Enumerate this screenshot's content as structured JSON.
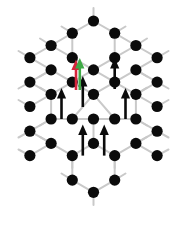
{
  "figure": {
    "type": "lattice-diagram",
    "width": 187,
    "height": 226,
    "background_color": "#ffffff"
  },
  "style": {
    "node_color": "#0b0b0b",
    "node_radius": 5.6,
    "bond_color": "#c9c9c9",
    "bond_width": 2.0,
    "black_arrow_color": "#0b0b0b",
    "red_arrow_color": "#d6253c",
    "green_arrow_color": "#3faa46"
  },
  "lattice": {
    "description": "Honeycomb (graphene-like) lattice arranged as a hexagonal flower of seven hexagons",
    "center": [
      93.5,
      107.0
    ],
    "bond_length": 24.5,
    "node_count": 38,
    "nodes": [
      {
        "id": "n01",
        "x": 93.5,
        "y": 21.0,
        "label": "top-apex"
      },
      {
        "id": "n02",
        "x": 72.3,
        "y": 33.2,
        "label": "upper-ring"
      },
      {
        "id": "n03",
        "x": 114.7,
        "y": 33.2,
        "label": "upper-ring"
      },
      {
        "id": "n04",
        "x": 72.3,
        "y": 57.7,
        "label": "upper-ring"
      },
      {
        "id": "n05",
        "x": 114.7,
        "y": 57.7,
        "label": "upper-ring"
      },
      {
        "id": "n06",
        "x": 51.1,
        "y": 45.5,
        "label": "upper-left"
      },
      {
        "id": "n07",
        "x": 135.9,
        "y": 45.5,
        "label": "upper-right"
      },
      {
        "id": "n08",
        "x": 29.9,
        "y": 57.7,
        "label": "left-ring"
      },
      {
        "id": "n09",
        "x": 157.1,
        "y": 57.7,
        "label": "right-ring"
      },
      {
        "id": "n10",
        "x": 51.1,
        "y": 69.9,
        "label": "left-ring"
      },
      {
        "id": "n11",
        "x": 93.5,
        "y": 69.9,
        "label": "center-upper"
      },
      {
        "id": "n12",
        "x": 135.9,
        "y": 69.9,
        "label": "right-ring"
      },
      {
        "id": "n13",
        "x": 29.9,
        "y": 82.1,
        "label": "left-ring"
      },
      {
        "id": "n14",
        "x": 157.1,
        "y": 82.1,
        "label": "right-ring"
      },
      {
        "id": "n15",
        "x": 51.1,
        "y": 94.3,
        "label": "left-ring"
      },
      {
        "id": "n16",
        "x": 93.5,
        "y": 94.3,
        "label": "center"
      },
      {
        "id": "n17",
        "x": 135.9,
        "y": 94.3,
        "label": "right-ring"
      },
      {
        "id": "n18",
        "x": 72.3,
        "y": 82.1,
        "label": "inner"
      },
      {
        "id": "n19",
        "x": 114.7,
        "y": 82.1,
        "label": "inner"
      },
      {
        "id": "n20",
        "x": 29.9,
        "y": 106.5,
        "label": "left-edge"
      },
      {
        "id": "n21",
        "x": 157.1,
        "y": 106.5,
        "label": "right-edge"
      },
      {
        "id": "n22",
        "x": 72.3,
        "y": 119.0,
        "label": "inner"
      },
      {
        "id": "n23",
        "x": 114.7,
        "y": 119.0,
        "label": "inner"
      },
      {
        "id": "n24",
        "x": 51.1,
        "y": 119.0,
        "label": "left-ring"
      },
      {
        "id": "n25",
        "x": 93.5,
        "y": 119.0,
        "label": "center-lower"
      },
      {
        "id": "n26",
        "x": 135.9,
        "y": 119.0,
        "label": "right-ring"
      },
      {
        "id": "n27",
        "x": 29.9,
        "y": 131.2,
        "label": "left-ring"
      },
      {
        "id": "n28",
        "x": 157.1,
        "y": 131.2,
        "label": "right-ring"
      },
      {
        "id": "n29",
        "x": 51.1,
        "y": 143.4,
        "label": "left-ring"
      },
      {
        "id": "n30",
        "x": 93.5,
        "y": 143.4,
        "label": "lower-center"
      },
      {
        "id": "n31",
        "x": 135.9,
        "y": 143.4,
        "label": "right-ring"
      },
      {
        "id": "n32",
        "x": 72.3,
        "y": 155.6,
        "label": "lower"
      },
      {
        "id": "n33",
        "x": 114.7,
        "y": 155.6,
        "label": "lower"
      },
      {
        "id": "n34",
        "x": 29.9,
        "y": 155.6,
        "label": "lower-left"
      },
      {
        "id": "n35",
        "x": 157.1,
        "y": 155.6,
        "label": "lower-right"
      },
      {
        "id": "n36",
        "x": 72.3,
        "y": 180.1,
        "label": "lower-ring"
      },
      {
        "id": "n37",
        "x": 114.7,
        "y": 180.1,
        "label": "lower-ring"
      },
      {
        "id": "n38",
        "x": 93.5,
        "y": 192.3,
        "label": "bottom-apex"
      }
    ],
    "bonds": [
      [
        "n01",
        "n02"
      ],
      [
        "n01",
        "n03"
      ],
      [
        "n02",
        "n04"
      ],
      [
        "n03",
        "n05"
      ],
      [
        "n02",
        "n06"
      ],
      [
        "n03",
        "n07"
      ],
      [
        "n06",
        "n08"
      ],
      [
        "n07",
        "n09"
      ],
      [
        "n06",
        "n04"
      ],
      [
        "n07",
        "n05"
      ],
      [
        "n04",
        "n11"
      ],
      [
        "n05",
        "n11"
      ],
      [
        "n08",
        "n10"
      ],
      [
        "n09",
        "n12"
      ],
      [
        "n10",
        "n13"
      ],
      [
        "n12",
        "n14"
      ],
      [
        "n10",
        "n18"
      ],
      [
        "n12",
        "n19"
      ],
      [
        "n11",
        "n18"
      ],
      [
        "n11",
        "n19"
      ],
      [
        "n13",
        "n15"
      ],
      [
        "n14",
        "n17"
      ],
      [
        "n15",
        "n18"
      ],
      [
        "n17",
        "n19"
      ],
      [
        "n18",
        "n16"
      ],
      [
        "n19",
        "n16"
      ],
      [
        "n15",
        "n20"
      ],
      [
        "n17",
        "n21"
      ],
      [
        "n15",
        "n24"
      ],
      [
        "n17",
        "n26"
      ],
      [
        "n16",
        "n22"
      ],
      [
        "n16",
        "n23"
      ],
      [
        "n22",
        "n24"
      ],
      [
        "n23",
        "n26"
      ],
      [
        "n22",
        "n25"
      ],
      [
        "n23",
        "n25"
      ],
      [
        "n24",
        "n27"
      ],
      [
        "n26",
        "n28"
      ],
      [
        "n27",
        "n29"
      ],
      [
        "n28",
        "n31"
      ],
      [
        "n29",
        "n32"
      ],
      [
        "n31",
        "n33"
      ],
      [
        "n29",
        "n34"
      ],
      [
        "n31",
        "n35"
      ],
      [
        "n25",
        "n30"
      ],
      [
        "n30",
        "n32"
      ],
      [
        "n30",
        "n33"
      ],
      [
        "n32",
        "n36"
      ],
      [
        "n33",
        "n37"
      ],
      [
        "n36",
        "n38"
      ],
      [
        "n37",
        "n38"
      ]
    ],
    "stub_bonds": [
      {
        "from": [
          93.5,
          21.0
        ],
        "to": [
          93.5,
          8.0
        ]
      },
      {
        "from": [
          51.1,
          45.5
        ],
        "to": [
          40.0,
          38.5
        ]
      },
      {
        "from": [
          135.9,
          45.5
        ],
        "to": [
          147.0,
          38.5
        ]
      },
      {
        "from": [
          29.9,
          57.7
        ],
        "to": [
          18.5,
          51.0
        ]
      },
      {
        "from": [
          157.1,
          57.7
        ],
        "to": [
          168.5,
          51.0
        ]
      },
      {
        "from": [
          29.9,
          82.1
        ],
        "to": [
          18.5,
          88.5
        ]
      },
      {
        "from": [
          157.1,
          82.1
        ],
        "to": [
          168.5,
          88.5
        ]
      },
      {
        "from": [
          29.9,
          106.5
        ],
        "to": [
          18.5,
          100.0
        ]
      },
      {
        "from": [
          157.1,
          106.5
        ],
        "to": [
          168.5,
          100.0
        ]
      },
      {
        "from": [
          29.9,
          131.2
        ],
        "to": [
          18.5,
          137.5
        ]
      },
      {
        "from": [
          157.1,
          131.2
        ],
        "to": [
          168.5,
          137.5
        ]
      },
      {
        "from": [
          29.9,
          155.6
        ],
        "to": [
          18.5,
          149.5
        ]
      },
      {
        "from": [
          157.1,
          155.6
        ],
        "to": [
          168.5,
          149.5
        ]
      },
      {
        "from": [
          72.3,
          180.1
        ],
        "to": [
          61.5,
          173.5
        ]
      },
      {
        "from": [
          114.7,
          180.1
        ],
        "to": [
          125.5,
          173.5
        ]
      },
      {
        "from": [
          93.5,
          192.3
        ],
        "to": [
          93.5,
          205.0
        ]
      },
      {
        "from": [
          51.1,
          69.9
        ],
        "to": [
          40.0,
          76.5
        ]
      },
      {
        "from": [
          135.9,
          69.9
        ],
        "to": [
          147.0,
          76.5
        ]
      },
      {
        "from": [
          51.1,
          94.3
        ],
        "to": [
          40.0,
          87.7
        ]
      },
      {
        "from": [
          135.9,
          94.3
        ],
        "to": [
          147.0,
          87.7
        ]
      },
      {
        "from": [
          51.1,
          119.0
        ],
        "to": [
          40.0,
          125.5
        ]
      },
      {
        "from": [
          135.9,
          119.0
        ],
        "to": [
          147.0,
          125.5
        ]
      },
      {
        "from": [
          51.1,
          143.4
        ],
        "to": [
          40.0,
          136.8
        ]
      },
      {
        "from": [
          135.9,
          143.4
        ],
        "to": [
          147.0,
          136.8
        ]
      },
      {
        "from": [
          72.3,
          155.6
        ],
        "to": [
          72.3,
          168.0
        ]
      },
      {
        "from": [
          114.7,
          155.6
        ],
        "to": [
          114.7,
          168.0
        ]
      },
      {
        "from": [
          72.3,
          33.2
        ],
        "to": [
          61.5,
          26.5
        ]
      },
      {
        "from": [
          114.7,
          33.2
        ],
        "to": [
          125.5,
          26.5
        ]
      }
    ]
  },
  "spins": {
    "description": "Upward-pointing spin arrows placed at hexagon centers",
    "black_arrows": [
      {
        "id": "spin-1",
        "x": 114.7,
        "y_tail": 89.0,
        "y_head": 58.0,
        "color": "#0b0b0b"
      },
      {
        "id": "spin-2",
        "x": 61.5,
        "y_tail": 119.0,
        "y_head": 88.0,
        "color": "#0b0b0b"
      },
      {
        "id": "spin-3",
        "x": 125.5,
        "y_tail": 119.0,
        "y_head": 88.0,
        "color": "#0b0b0b"
      },
      {
        "id": "spin-4",
        "x": 82.8,
        "y_tail": 155.6,
        "y_head": 124.5,
        "color": "#0b0b0b"
      },
      {
        "id": "spin-5",
        "x": 104.2,
        "y_tail": 155.6,
        "y_head": 124.5,
        "color": "#0b0b0b"
      },
      {
        "id": "spin-6",
        "x": 82.8,
        "y_tail": 107.0,
        "y_head": 76.0,
        "color": "#0b0b0b"
      }
    ],
    "colored_arrows": [
      {
        "id": "spin-red",
        "x": 76.0,
        "y_tail": 90.0,
        "y_head": 59.5,
        "color": "#d6253c",
        "role": "reference-direction"
      },
      {
        "id": "spin-green",
        "x": 79.8,
        "y_tail": 90.0,
        "y_head": 58.0,
        "color": "#3faa46",
        "role": "rotated-direction"
      }
    ]
  }
}
